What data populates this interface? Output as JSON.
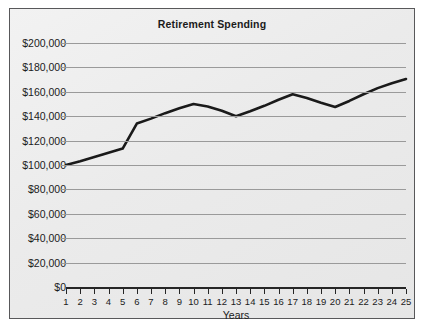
{
  "chart_data": {
    "type": "line",
    "title": "Retirement Spending",
    "xlabel": "Years",
    "ylabel": "",
    "grid": true,
    "legend": false,
    "xlim": [
      1,
      25
    ],
    "ylim": [
      0,
      200000
    ],
    "x": [
      1,
      2,
      3,
      4,
      5,
      6,
      7,
      8,
      9,
      10,
      11,
      12,
      13,
      14,
      15,
      16,
      17,
      18,
      19,
      20,
      21,
      22,
      23,
      24,
      25
    ],
    "xtick_labels": [
      "1",
      "2",
      "3",
      "4",
      "5",
      "6",
      "7",
      "8",
      "9",
      "10",
      "11",
      "12",
      "13",
      "14",
      "15",
      "16",
      "17",
      "18",
      "19",
      "20",
      "21",
      "22",
      "23",
      "24",
      "25"
    ],
    "ytick_values": [
      0,
      20000,
      40000,
      60000,
      80000,
      100000,
      120000,
      140000,
      160000,
      180000,
      200000
    ],
    "ytick_labels": [
      "$0",
      "$20,000",
      "$40,000",
      "$60,000",
      "$80,000",
      "$100,000",
      "$120,000",
      "$140,000",
      "$160,000",
      "$180,000",
      "$200,000"
    ],
    "series": [
      {
        "name": "Retirement Spending",
        "color": "#1a1a1a",
        "values": [
          100000,
          103000,
          106500,
          110000,
          113500,
          134000,
          138000,
          142500,
          146500,
          150000,
          148000,
          144500,
          140000,
          144000,
          148500,
          153500,
          158000,
          155000,
          151000,
          147500,
          152500,
          158000,
          163000,
          167000,
          170500
        ]
      }
    ]
  },
  "colors": {
    "line": "#1a1a1a",
    "grid": "#9a9a9a",
    "axis": "#262626",
    "border": "#58585a",
    "background": "#ececec",
    "text": "#1b1b1b"
  }
}
